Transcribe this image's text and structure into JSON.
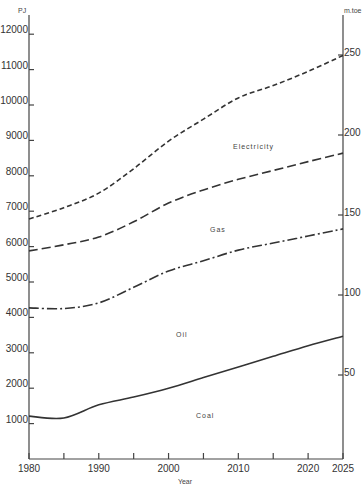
{
  "chart_data": {
    "type": "line",
    "title": "",
    "xlabel": "Year",
    "ylabel": "PJ",
    "ylabel_right": "m.toe",
    "xlim": [
      1980,
      2025
    ],
    "ylim": [
      0,
      12000
    ],
    "ylim_right": [
      0,
      262
    ],
    "x_ticks": [
      1980,
      1985,
      1990,
      1995,
      2000,
      2005,
      2010,
      2015,
      2020,
      2025
    ],
    "x_tick_labels": [
      "1980",
      "1990",
      "2000",
      "2010",
      "2020",
      "2025"
    ],
    "y_ticks_left": [
      1000,
      2000,
      3000,
      4000,
      5000,
      6000,
      7000,
      8000,
      9000,
      10000,
      11000,
      12000
    ],
    "y_ticks_right": [
      50,
      100,
      150,
      200,
      250
    ],
    "grid": false,
    "legend": "inline labels between curves",
    "x": [
      1980,
      1985,
      1990,
      1995,
      2000,
      2005,
      2010,
      2015,
      2020,
      2025
    ],
    "series": [
      {
        "name": "Electricity",
        "style": "dashed (short)",
        "values": [
          6780,
          7100,
          7510,
          8200,
          8980,
          9600,
          10200,
          10550,
          10950,
          11400
        ]
      },
      {
        "name": "Gas",
        "style": "dashed (long)",
        "values": [
          5880,
          6050,
          6270,
          6700,
          7230,
          7600,
          7900,
          8150,
          8400,
          8640
        ]
      },
      {
        "name": "Oil",
        "style": "dash-dot",
        "values": [
          4270,
          4250,
          4410,
          4850,
          5310,
          5600,
          5900,
          6100,
          6300,
          6500
        ]
      },
      {
        "name": "Coal",
        "style": "solid",
        "values": [
          1210,
          1160,
          1530,
          1750,
          2000,
          2300,
          2600,
          2900,
          3200,
          3470
        ]
      }
    ],
    "band_labels": [
      "Electricity",
      "Gas",
      "Oil",
      "Coal"
    ]
  },
  "axes": {
    "left_unit": "PJ",
    "right_unit": "m.toe",
    "x_title": "Year",
    "left_ticks": [
      "1000",
      "2000",
      "3000",
      "4000",
      "5000",
      "6000",
      "7000",
      "8000",
      "9000",
      "10000",
      "11000",
      "12000"
    ],
    "right_ticks": [
      "50",
      "100",
      "150",
      "200",
      "250"
    ],
    "x_ticks": [
      "1980",
      "1990",
      "2000",
      "2010",
      "2020",
      "2025"
    ]
  },
  "labels": {
    "electricity": "Electricity",
    "gas": "Gas",
    "oil": "Oil",
    "coal": "Coal"
  }
}
